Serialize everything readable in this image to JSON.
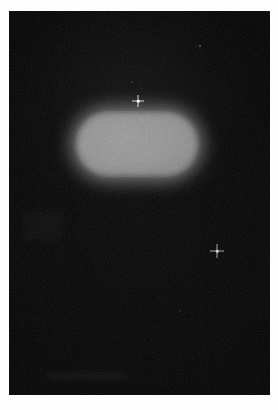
{
  "image": {
    "title": "Dark-field micrograph of a bright capsule-shaped object",
    "caption": "",
    "width": 278,
    "height": 410,
    "modality": "grayscale photographic scan",
    "background_description": "near-black dark field framed by a white page margin"
  },
  "colors": {
    "page_margin": "#fefefe",
    "dark_field": "#020202",
    "object_fill": "#8f8f8f",
    "object_edge_glow": "#8d8d8d",
    "speck_highlight": "#ffffff"
  },
  "frame": {
    "margin_left_px": 9,
    "margin_top_px": 11,
    "margin_right_px": 8,
    "margin_bottom_px": 15,
    "field_width_px": 261,
    "field_height_px": 384
  },
  "objects": {
    "primary": {
      "label": "bright-capsule-object",
      "shape": "stadium / rounded rectangle",
      "center_x": 138,
      "center_y": 144,
      "width_px": 124,
      "height_px": 66,
      "corner_radius_px": 33,
      "fill_hex": "#8f8f8f",
      "edge": "soft / out-of-focus blur",
      "texture": "fine uniform grain"
    },
    "specks": [
      {
        "label": "speck-upper-center",
        "shape": "cross / diffraction spike",
        "x": 138,
        "y": 101,
        "size_px": 11,
        "brightness": "high"
      },
      {
        "label": "speck-lower-right",
        "shape": "cross / diffraction spike",
        "x": 217,
        "y": 251,
        "size_px": 13,
        "brightness": "medium"
      }
    ],
    "faint_dots": [
      {
        "label": "faint-dot-upper-right",
        "x": 200,
        "y": 46,
        "size_px": 2
      },
      {
        "label": "faint-dot-above-capsule",
        "x": 132,
        "y": 82,
        "size_px": 2
      },
      {
        "label": "faint-dot-lower-center",
        "x": 180,
        "y": 311,
        "size_px": 2
      }
    ]
  }
}
